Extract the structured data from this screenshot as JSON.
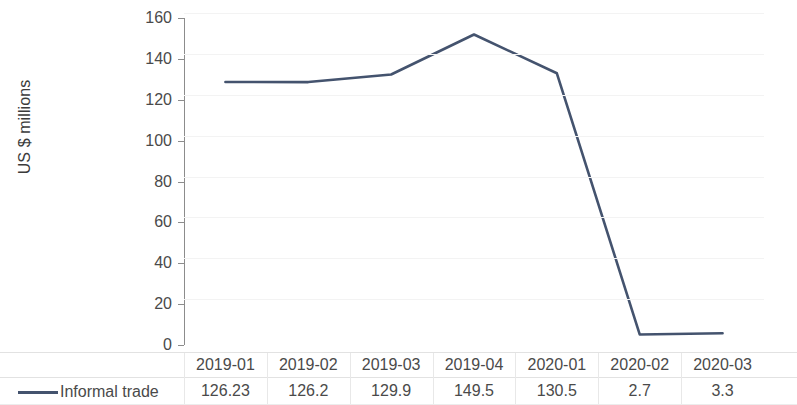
{
  "chart_data": {
    "type": "line",
    "title": "",
    "xlabel": "",
    "ylabel": "US $ millions",
    "categories": [
      "2019-01",
      "2019-02",
      "2019-03",
      "2019-04",
      "2020-01",
      "2020-02",
      "2020-03"
    ],
    "series": [
      {
        "name": "Informal trade",
        "values": [
          126.23,
          126.2,
          129.9,
          149.5,
          130.5,
          2.7,
          3.3
        ],
        "color": "#44536e"
      }
    ],
    "ylim": [
      0,
      160
    ],
    "yticks": [
      0,
      20,
      40,
      60,
      80,
      100,
      120,
      140,
      160
    ],
    "ytick_labels": [
      "0",
      "20",
      "40",
      "60",
      "80",
      "100",
      "120",
      "140",
      "160"
    ],
    "grid": true,
    "grid_axis": "y",
    "legend_position": "bottom",
    "has_data_table": true,
    "value_labels": [
      "126.23",
      "126.2",
      "129.9",
      "149.5",
      "130.5",
      "2.7",
      "3.3"
    ]
  },
  "axis": {
    "y_title": "US $ millions"
  },
  "legend": {
    "series_label": "Informal trade",
    "swatch_icon": "line-swatch-icon",
    "swatch_color": "#44536e"
  },
  "colors": {
    "series_line": "#44536e",
    "axis": "#8c8c8c",
    "gridline": "#f3f3f3",
    "table_rule": "#e2e2e2",
    "text": "#4a4a4a",
    "background": "#ffffff"
  }
}
